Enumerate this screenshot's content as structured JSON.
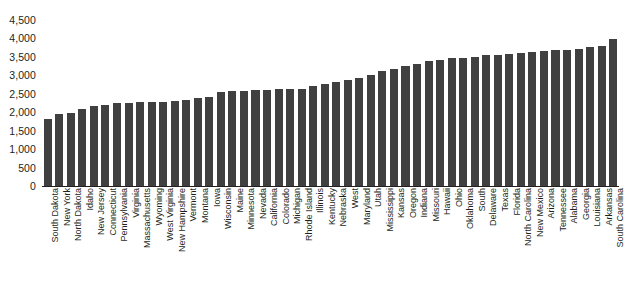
{
  "chart_data": {
    "type": "bar",
    "title": "",
    "subtitle": "",
    "xlabel": "",
    "ylabel": "",
    "ylim": [
      0,
      4500
    ],
    "ytick_step": 500,
    "grid": false,
    "legend": null,
    "bar_color": "#404040",
    "axis_color": "#231f20",
    "ytick_labels": [
      "4,500",
      "4,000",
      "3,500",
      "3,000",
      "2,500",
      "2,000",
      "1,500",
      "1,000",
      "500",
      "0"
    ],
    "ytick_values": [
      4500,
      4000,
      3500,
      3000,
      2500,
      2000,
      1500,
      1000,
      500,
      0
    ],
    "categories": [
      "South Dakota",
      "New York",
      "North Dakota",
      "Idaho",
      "New Jersey",
      "Connecticut",
      "Pennsylvania",
      "Virginia",
      "Massachusetts",
      "Wyoming",
      "West Virginia",
      "New Hampshire",
      "Vermont",
      "Montana",
      "Iowa",
      "Wisconsin",
      "Maine",
      "Minnesota",
      "Nevada",
      "California",
      "Colorado",
      "Michigan",
      "Rhode Island",
      "Illinois",
      "Kentucky",
      "Nebraska",
      "West",
      "Maryland",
      "Utah",
      "Mississippi",
      "Kansas",
      "Oregon",
      "Indiana",
      "Missouri",
      "Hawaii",
      "Ohio",
      "Oklahoma",
      "South",
      "Delaware",
      "Texas",
      "Florida",
      "North Carolina",
      "New Mexico",
      "Arizona",
      "Tennessee",
      "Alabama",
      "Georgia",
      "Louisiana",
      "Arkansas",
      "South Carolina"
    ],
    "values": [
      1830,
      1950,
      1980,
      2090,
      2180,
      2200,
      2240,
      2260,
      2270,
      2280,
      2290,
      2310,
      2340,
      2380,
      2420,
      2560,
      2570,
      2580,
      2600,
      2610,
      2620,
      2630,
      2640,
      2700,
      2760,
      2820,
      2880,
      2940,
      3020,
      3120,
      3180,
      3240,
      3300,
      3380,
      3420,
      3460,
      3480,
      3500,
      3540,
      3560,
      3580,
      3600,
      3620,
      3660,
      3680,
      3700,
      3720,
      3760,
      3800,
      3990
    ]
  }
}
